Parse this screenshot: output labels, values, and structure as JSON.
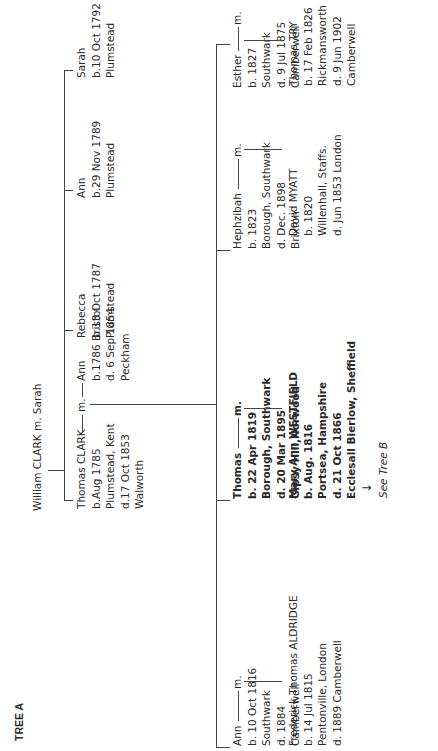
{
  "title": "TREE A",
  "root": {
    "label": "William CLARK m. Sarah"
  },
  "generation1": [
    {
      "name": "Thomas CLARK",
      "marriage": "m.",
      "details": [
        "b.Aug 1785",
        "Plumstead, Kent",
        "d.17 Oct 1853",
        "Walworth"
      ],
      "spouse": {
        "name": "Ann",
        "details": [
          "b.1786 Bristol",
          "d. 6 Sep 1854",
          "Peckham"
        ]
      }
    },
    {
      "name": "Rebecca",
      "details": [
        "b.13 Oct 1787",
        "Plumstead"
      ]
    },
    {
      "name": "Ann",
      "details": [
        "b.29 Nov 1789",
        "Plumstead"
      ]
    },
    {
      "name": "Sarah",
      "details": [
        "b.10 Oct 1792",
        "Plumstead"
      ]
    }
  ],
  "generation2": [
    {
      "name": "Ann",
      "marriage": "m.",
      "details": [
        "b. 10 Oct 1816",
        "Southwark",
        "d. 1884",
        "Camberwell"
      ],
      "spouse": {
        "name": "Frederick Thomas ALDRIDGE",
        "details": [
          "b. 14 Jul 1815",
          "Pentonville, London",
          "d. 1889 Camberwell"
        ]
      }
    },
    {
      "name": "Thomas",
      "marriage": "m.",
      "details": [
        "b. 22 Apr 1819",
        "Borough, Southwark",
        "d. 20 Mar 1895",
        "Gipsy Hill,Norwood"
      ],
      "spouse": {
        "name": "Mary Ann WESTFIELD",
        "details": [
          "b. Aug. 1816",
          "Portsea, Hampshire",
          "d. 21 Oct 1866",
          "Ecclesall Bierlow, Sheffield"
        ]
      },
      "arrow": "↓",
      "see_also": "See Tree B"
    },
    {
      "name": "Hephzibah",
      "marriage": "m.",
      "details": [
        "b. 1823",
        "Borough, Southwark",
        "d. Dec. 1898",
        "Brixton"
      ],
      "spouse": {
        "name": "David MYATT",
        "details": [
          "b. 1820",
          "Willenhall, Staffs.",
          "d. Jun 1853 London"
        ]
      }
    },
    {
      "name": "Esther",
      "marriage": "m.",
      "details": [
        "b. 1827",
        "Southwark",
        "d. 9 Jul 1875",
        "Camberwell"
      ],
      "spouse": {
        "name": "Thomas TRY",
        "details": [
          "b. 17 Feb 1826",
          "Rickmansworth",
          "d. 9 Jun 1902",
          "Camberwell"
        ]
      }
    }
  ]
}
